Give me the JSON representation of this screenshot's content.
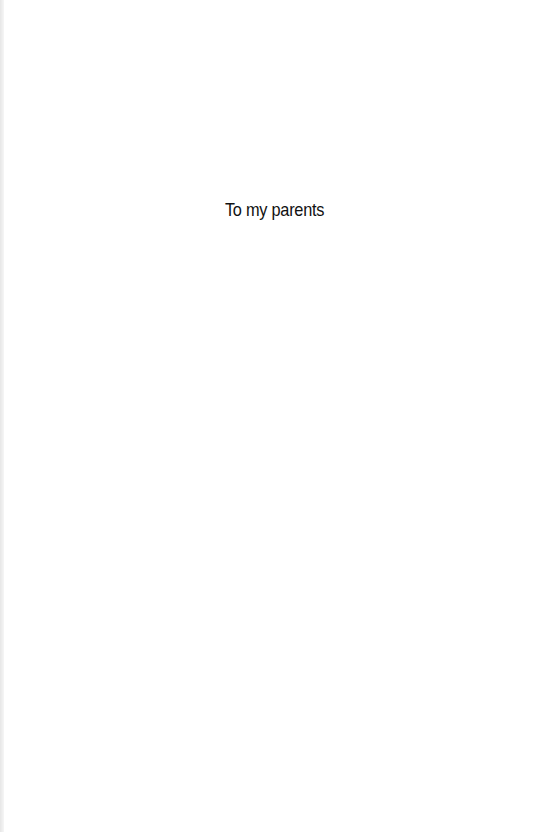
{
  "page": {
    "dedication": "To my parents"
  }
}
